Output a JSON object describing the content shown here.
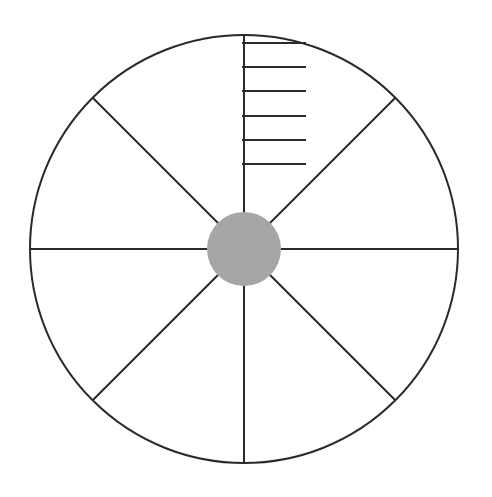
{
  "diagram": {
    "type": "segmented-circle",
    "background": "#ffffff",
    "stroke_color": "#2a2a2a",
    "hub_color": "#a6a6a6",
    "circle": {
      "cx": 244,
      "cy": 249,
      "r": 214
    },
    "hub": {
      "r": 37
    },
    "spokes": 8,
    "spoke_angles_deg": [
      0,
      45,
      90,
      135,
      180,
      225,
      270,
      315
    ],
    "scale_marks": {
      "x_start": 242,
      "x_end": 306,
      "y_positions": [
        43,
        67,
        91,
        116,
        140,
        164
      ]
    }
  }
}
